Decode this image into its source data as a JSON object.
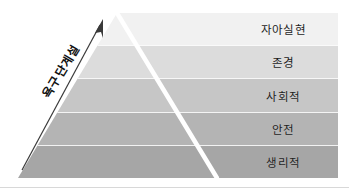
{
  "figure": {
    "type": "maslow-hierarchy-of-needs-pyramid",
    "axis_caption": "욕구단계설",
    "arrow": "up-right-arrow-icon",
    "background_color": "#ffffff",
    "levels": [
      {
        "label": "자아실현",
        "color": "#f1f1f1",
        "rank": 5
      },
      {
        "label": "존경",
        "color": "#dcdcdc",
        "rank": 4
      },
      {
        "label": "사회적",
        "color": "#c6c6c6",
        "rank": 3
      },
      {
        "label": "안전",
        "color": "#b4b4b4",
        "rank": 2
      },
      {
        "label": "생리적",
        "color": "#a6a6a6",
        "rank": 1
      }
    ],
    "divider_color": "#ffffff",
    "rule_color": "#d8d8d8"
  }
}
